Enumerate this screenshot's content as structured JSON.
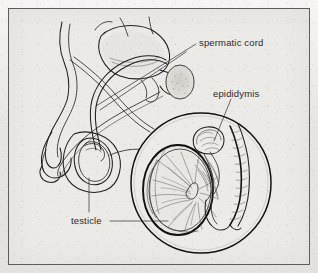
{
  "figure": {
    "style": "pen-and-ink line drawing, grayscale scan",
    "background_color": "#ebeae7",
    "border_color": "#5d5c5a",
    "ink_color": "#1a1a1a"
  },
  "labels": {
    "spermatic_cord": "spermatic cord",
    "epididymis": "epididymis",
    "testicle": "testicle"
  },
  "leader_lines": [
    {
      "name": "spermatic-cord-leader",
      "from": [
        196,
        44
      ],
      "to": [
        96,
        106
      ]
    },
    {
      "name": "epididymis-leader",
      "from": [
        231,
        99
      ],
      "to": [
        214,
        141
      ]
    },
    {
      "name": "testicle-leader-vertical",
      "from": [
        89,
        178
      ],
      "to": [
        89,
        212
      ]
    },
    {
      "name": "testicle-leader-horizontal",
      "from": [
        110,
        221
      ],
      "to": [
        168,
        221
      ]
    }
  ],
  "inset": {
    "name": "magnified-circle",
    "center": [
      201,
      183
    ],
    "radius": 70,
    "contents": [
      "testicle cross-section",
      "epididymis coiled tube"
    ]
  },
  "sagittal_view": {
    "name": "male-pelvis-sagittal-drawing",
    "parts": [
      "bladder",
      "penis",
      "urethra",
      "vas deferens",
      "scrotum",
      "testis",
      "prostate"
    ]
  }
}
